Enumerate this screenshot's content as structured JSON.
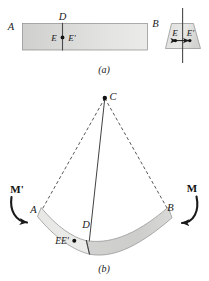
{
  "figure": {
    "caption_a": "(a)",
    "caption_b": "(b)",
    "colors": {
      "beam_fill_light": "#e3e3e1",
      "beam_fill_dark": "#c9c9c7",
      "outline": "#6f6f6f",
      "line": "#2b2b2b",
      "dashed": "#3a3a3a",
      "text": "#1a1a1a"
    },
    "panel_a": {
      "name": "straight-beam-panel",
      "labels": {
        "left_end": "A",
        "right_end": "B",
        "top_center": "D",
        "point_left": "E",
        "point_right": "E'"
      },
      "cross_section": {
        "name": "cross-section-inset",
        "labels": {
          "point_left": "E",
          "point_right": "E'"
        }
      }
    },
    "panel_b": {
      "name": "bent-beam-panel",
      "labels": {
        "center_of_curvature": "C",
        "left_end": "A",
        "right_end": "B",
        "neutral_axis_point": "D",
        "fiber_points": "EE'",
        "moment_left": "M'",
        "moment_right": "M"
      }
    }
  }
}
